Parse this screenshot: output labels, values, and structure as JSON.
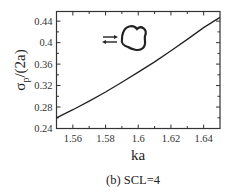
{
  "chart_data": {
    "type": "line",
    "title": "",
    "caption": "(b) SCL=4",
    "xlabel": "ka",
    "ylabel_main": "σ",
    "ylabel_sub": "p",
    "ylabel_rest": "/(2a)",
    "xlim": [
      1.55,
      1.65
    ],
    "ylim": [
      0.24,
      0.458
    ],
    "x_ticks": [
      1.56,
      1.58,
      1.6,
      1.62,
      1.64
    ],
    "x_tick_labels": [
      "1.56",
      "1.58",
      "1.6",
      "1.62",
      "1.64"
    ],
    "x_minor_ticks": [
      1.57,
      1.59,
      1.61,
      1.63
    ],
    "y_ticks": [
      0.24,
      0.28,
      0.32,
      0.36,
      0.4,
      0.44
    ],
    "y_tick_labels": [
      "0.24",
      "0.28",
      "0.32",
      "0.36",
      "0.4",
      "0.44"
    ],
    "y_minor_ticks": [
      0.26,
      0.3,
      0.34,
      0.38,
      0.42
    ],
    "grid": false,
    "legend": null,
    "series": [
      {
        "name": "sigma_p/(2a)",
        "color": "#222222",
        "x": [
          1.55,
          1.56,
          1.57,
          1.58,
          1.59,
          1.6,
          1.61,
          1.62,
          1.63,
          1.64,
          1.65
        ],
        "y": [
          0.26,
          0.275,
          0.291,
          0.308,
          0.326,
          0.345,
          0.364,
          0.385,
          0.406,
          0.428,
          0.447
        ]
      }
    ],
    "annotations": [
      {
        "type": "inset-icon",
        "name": "trefoil-scatterer-with-bidirectional-arrows",
        "x": 1.585,
        "y": 0.4
      }
    ]
  }
}
